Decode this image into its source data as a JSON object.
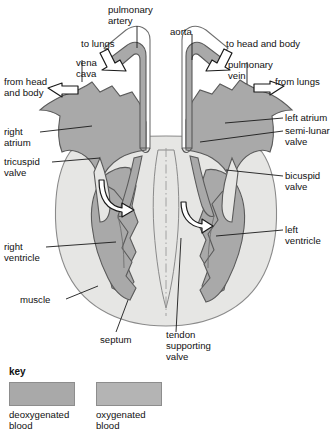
{
  "figure": {
    "kind": "anatomical-diagram",
    "colors": {
      "deoxygenated_blood_fill": "#a9a9a9",
      "oxygenated_blood_fill": "#a9a9a9",
      "muscle_fill": "#e6e6e4",
      "vessel_wall_fill": "#ffffff",
      "outline": "#4a4a4a",
      "leader_line": "#1a1a1a",
      "arrow_fill": "#ffffff",
      "arrow_stroke": "#1a1a1a",
      "text": "#111111",
      "background": "#ffffff"
    }
  },
  "labels": {
    "pulmonary_artery": "pulmonary\nartery",
    "aorta": "aorta",
    "to_lungs": "to lungs",
    "to_head_and_body": "to head and body",
    "vena_cava": "vena\ncava",
    "pulmonary_vein": "pulmonary\nvein",
    "from_head_and_body": "from head\nand body",
    "from_lungs": "from lungs",
    "right_atrium": "right\natrium",
    "left_atrium": "left atrium",
    "semi_lunar_valve": "semi-lunar\nvalve",
    "tricuspid_valve": "tricuspid\nvalve",
    "bicuspid_valve": "bicuspid\nvalve",
    "right_ventricle": "right\nventricle",
    "left_ventricle": "left\nventricle",
    "muscle": "muscle",
    "septum": "septum",
    "tendon_supporting_valve": "tendon\nsupporting\nvalve"
  },
  "key": {
    "title": "key",
    "entries": [
      {
        "label": "deoxygenated\nblood",
        "color": "#a9a9a9"
      },
      {
        "label": "oxygenated\nblood",
        "color": "#b4b4b4"
      }
    ]
  },
  "flow_arrows": [
    {
      "name": "to-lungs-arrow",
      "direction": "out",
      "vessel": "pulmonary artery"
    },
    {
      "name": "to-head-and-body-arrow",
      "direction": "out",
      "vessel": "aorta"
    },
    {
      "name": "from-head-and-body-arrow",
      "direction": "in",
      "vessel": "vena cava"
    },
    {
      "name": "from-lungs-arrow",
      "direction": "in",
      "vessel": "pulmonary vein"
    },
    {
      "name": "tricuspid-flow-arrow",
      "direction": "down",
      "vessel": "right atrium to right ventricle"
    },
    {
      "name": "bicuspid-flow-arrow",
      "direction": "down",
      "vessel": "left atrium to left ventricle"
    }
  ]
}
